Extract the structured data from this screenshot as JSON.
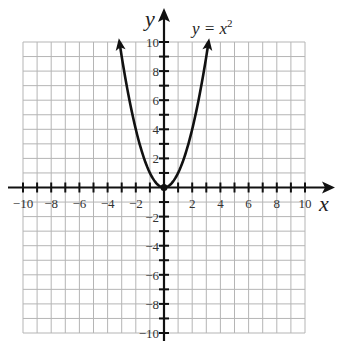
{
  "chart_data": {
    "type": "line",
    "equation": "y = x^2",
    "xlabel": "x",
    "ylabel": "y",
    "xlim": [
      -10,
      10
    ],
    "ylim": [
      -10,
      10
    ],
    "grid": true,
    "grid_step": 1,
    "x_tick_labels": [
      "-10",
      "-8",
      "-6",
      "-4",
      "-2",
      "2",
      "4",
      "6",
      "8",
      "10"
    ],
    "y_tick_labels": [
      "10",
      "8",
      "6",
      "4",
      "2",
      "-2",
      "-4",
      "-6",
      "-8",
      "-10"
    ],
    "series": [
      {
        "name": "y = x²",
        "x": [
          -3.16,
          -3,
          -2,
          -1,
          0,
          1,
          2,
          3,
          3.16
        ],
        "y": [
          10,
          9,
          4,
          1,
          0,
          1,
          4,
          9,
          10
        ],
        "arrows_at_ends": true
      }
    ],
    "vertex": [
      0,
      0
    ]
  },
  "labels": {
    "x_axis": "x",
    "y_axis": "y",
    "curve_label_main": "y = x",
    "curve_label_exp": "2"
  }
}
